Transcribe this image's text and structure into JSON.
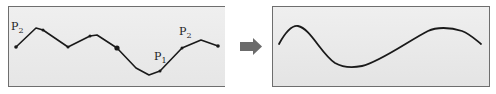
{
  "figure": {
    "left_panel": {
      "label_start": "P",
      "label_start_sub": "2",
      "label_p1": "P",
      "label_p1_sub": "1",
      "label_p2": "P",
      "label_p2_sub": "2",
      "polyline_points": [
        [
          16,
          47
        ],
        [
          36,
          28
        ],
        [
          43,
          30
        ],
        [
          68,
          47
        ],
        [
          90,
          36
        ],
        [
          97,
          35
        ],
        [
          117,
          48
        ],
        [
          136,
          68
        ],
        [
          149,
          75
        ],
        [
          160,
          71
        ],
        [
          182,
          48
        ],
        [
          201,
          40
        ],
        [
          218,
          46
        ]
      ],
      "highlighted_point": [
        117,
        48
      ]
    },
    "arrow": {
      "direction": "right",
      "color": "#6b6b6b"
    },
    "right_panel": {
      "curve_points": [
        [
          279,
          44
        ],
        [
          297,
          26
        ],
        [
          333,
          61
        ],
        [
          350,
          67
        ],
        [
          375,
          60
        ],
        [
          428,
          31
        ],
        [
          446,
          28
        ],
        [
          462,
          31
        ],
        [
          481,
          44
        ]
      ]
    },
    "colors": {
      "line": "#1a1a1a",
      "panel_bg": "#ececec",
      "border": "#6e6e6e"
    }
  }
}
